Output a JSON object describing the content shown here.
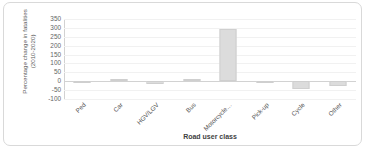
{
  "chart_data": {
    "type": "bar",
    "title": "",
    "xlabel": "Road user class",
    "ylabel_lines": [
      "Percentage change in fatalities",
      "(2010-2020)"
    ],
    "ylabel": "Percentage change in fatalities (2010-2020)",
    "categories": [
      "Ped",
      "Car",
      "HGV/LGV",
      "Bus",
      "Motorcycle…",
      "Pick-up",
      "Cycle",
      "Other"
    ],
    "values": [
      -5,
      12,
      -15,
      10,
      295,
      0,
      -45,
      -28
    ],
    "ylim": [
      -100,
      350
    ],
    "yticks": [
      350,
      300,
      250,
      200,
      150,
      100,
      50,
      0,
      -50,
      -100
    ],
    "ytick_labels": [
      "350",
      "300",
      "250",
      "200",
      "150",
      "100",
      "50",
      "0",
      "-50",
      "-100"
    ],
    "grid": true,
    "legend": false,
    "bar_color": "#dcdcdc",
    "axis_color": "#d2d2d2",
    "gridline_color": "#f1f1f1",
    "text_color": "#555555"
  }
}
